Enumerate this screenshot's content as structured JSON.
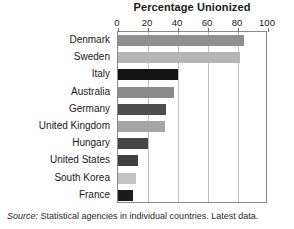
{
  "chart_data": {
    "type": "bar",
    "orientation": "horizontal",
    "title": "Percentage Unionized",
    "xlabel": "",
    "ylabel": "",
    "xlim": [
      0,
      100
    ],
    "xticks": [
      0,
      20,
      40,
      60,
      80,
      100
    ],
    "xtick_labels": [
      "0",
      "20",
      "40",
      "60",
      "80",
      "100"
    ],
    "grid": true,
    "legend": "none",
    "categories": [
      "Denmark",
      "Sweden",
      "Italy",
      "Australia",
      "Germany",
      "United Kingdom",
      "Hungary",
      "United States",
      "South Korea",
      "France"
    ],
    "values": [
      84,
      81,
      40,
      37,
      32,
      31,
      20,
      13,
      12,
      10
    ],
    "bar_colors": [
      "#8f8f8f",
      "#b5b5b5",
      "#131313",
      "#8a8a8a",
      "#4e4e4e",
      "#a5a5a5",
      "#464646",
      "#404040",
      "#c2c2c2",
      "#1c1c1c"
    ],
    "source_label": "Source:",
    "source_text": "Statistical agencies in individual countries. Latest data."
  },
  "style": {
    "frame_color": "#8a8a8a",
    "gridline_color": "#bdbdbd",
    "text_color": "#1a1a1a",
    "background": "#ffffff"
  }
}
